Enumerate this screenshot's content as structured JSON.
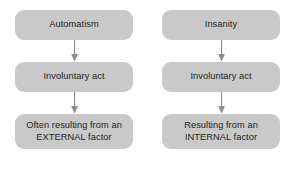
{
  "diagram": {
    "type": "flowchart",
    "title": "",
    "background_color": "#ffffff",
    "node_fill_color": "#c9c9c9",
    "text_color": "#231f20",
    "arrow_color": "#808080",
    "columns": [
      {
        "name": "automatism-branch",
        "nodes": [
          {
            "label": "Automatism"
          },
          {
            "label": "Involuntary act"
          },
          {
            "label_line1": "Often resulting from an",
            "label_line2": "EXTERNAL factor"
          }
        ]
      },
      {
        "name": "insanity-branch",
        "nodes": [
          {
            "label": "Insanity"
          },
          {
            "label": "Involuntary act"
          },
          {
            "label_line1": "Resulting from an",
            "label_line2": "INTERNAL factor"
          }
        ]
      }
    ]
  }
}
